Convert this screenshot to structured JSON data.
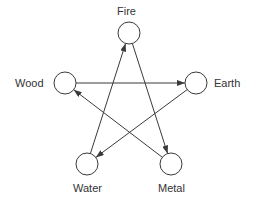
{
  "diagram": {
    "nodes": [
      {
        "id": "fire",
        "label": "Fire",
        "cx": 129,
        "cy": 33,
        "r": 11,
        "label_x": 117,
        "label_y": 5,
        "label_anchor": "top"
      },
      {
        "id": "wood",
        "label": "Wood",
        "cx": 65,
        "cy": 83,
        "r": 11,
        "label_x": 15,
        "label_y": 77,
        "label_anchor": "left"
      },
      {
        "id": "earth",
        "label": "Earth",
        "cx": 196,
        "cy": 83,
        "r": 11,
        "label_x": 214,
        "label_y": 77,
        "label_anchor": "right"
      },
      {
        "id": "water",
        "label": "Water",
        "cx": 87,
        "cy": 164,
        "r": 11,
        "label_x": 73,
        "label_y": 182,
        "label_anchor": "bottom"
      },
      {
        "id": "metal",
        "label": "Metal",
        "cx": 171,
        "cy": 164,
        "r": 11,
        "label_x": 158,
        "label_y": 182,
        "label_anchor": "bottom"
      }
    ],
    "edges": [
      {
        "from": "wood",
        "to": "earth"
      },
      {
        "from": "water",
        "to": "fire"
      },
      {
        "from": "fire",
        "to": "metal"
      },
      {
        "from": "earth",
        "to": "water"
      },
      {
        "from": "metal",
        "to": "wood"
      }
    ],
    "colors": {
      "stroke": "#3a3a3a",
      "text": "#333333",
      "background": "#ffffff"
    }
  }
}
